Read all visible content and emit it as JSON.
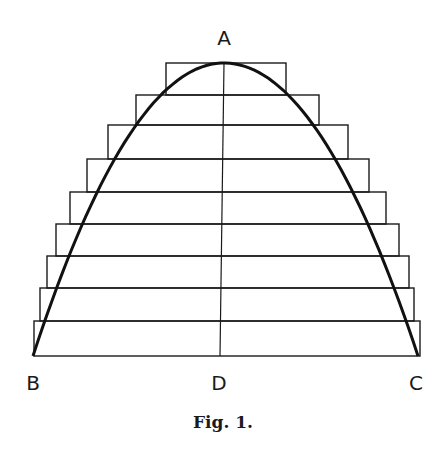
{
  "figure": {
    "caption": "Fig. 1.",
    "labels": {
      "apex": "A",
      "left_base": "B",
      "center_base": "D",
      "right_base": "C"
    },
    "colors": {
      "ink": "#1a1a1a",
      "background": "#ffffff"
    }
  },
  "diagram": {
    "axis_x": 224,
    "apex": [
      224,
      63
    ],
    "base_y": 356,
    "base_left_x": 33,
    "base_right_x": 418,
    "steps": [
      {
        "top": 63,
        "bottom": 95,
        "left": 166,
        "right": 286
      },
      {
        "top": 95,
        "bottom": 125,
        "left": 136,
        "right": 319
      },
      {
        "top": 125,
        "bottom": 159,
        "left": 108,
        "right": 348
      },
      {
        "top": 159,
        "bottom": 192,
        "left": 87,
        "right": 369
      },
      {
        "top": 192,
        "bottom": 224,
        "left": 70,
        "right": 386
      },
      {
        "top": 224,
        "bottom": 256,
        "left": 56,
        "right": 399
      },
      {
        "top": 256,
        "bottom": 288,
        "left": 47,
        "right": 409
      },
      {
        "top": 288,
        "bottom": 321,
        "left": 40,
        "right": 414
      },
      {
        "top": 321,
        "bottom": 356,
        "left": 34,
        "right": 420
      }
    ]
  }
}
